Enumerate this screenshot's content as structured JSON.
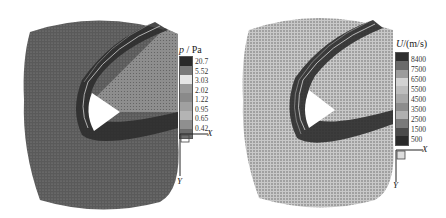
{
  "figure": {
    "panels": [
      {
        "id": "pressure",
        "variable_symbol": "p",
        "unit": "Pa",
        "title_sep": " / ",
        "colorbar_labels": [
          "20.7",
          "5.52",
          "3.03",
          "2.02",
          "1.22",
          "0.95",
          "0.65",
          "0.42"
        ],
        "colorbar_colors": [
          "#2a2a2a",
          "#7a7a7a",
          "#e6e6e6",
          "#9a9a9a",
          "#8a8a8a",
          "#a0a0a0",
          "#b4b4b4",
          "#8f8f8f",
          "#6c6c6c"
        ],
        "field_bg": "#5c5c5c",
        "axis_x": "X",
        "axis_y": "Y"
      },
      {
        "id": "velocity",
        "variable_symbol": "U",
        "unit": "(m/s)",
        "title_sep": "/",
        "colorbar_labels": [
          "8400",
          "7500",
          "6500",
          "5500",
          "4500",
          "3500",
          "2500",
          "1500",
          "500"
        ],
        "colorbar_colors": [
          "#2e2e2e",
          "#6a6a6a",
          "#9c9c9c",
          "#d2d2d2",
          "#bdbdbd",
          "#a8a8a8",
          "#8c8c8c",
          "#b0b0b0",
          "#7a7a7a",
          "#4a4a4a",
          "#2a2a2a"
        ],
        "field_bg": "#b8b8b8",
        "axis_x": "X",
        "axis_y": "Y"
      }
    ]
  }
}
